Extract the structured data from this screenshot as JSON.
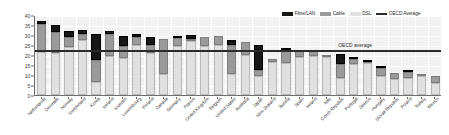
{
  "chart_data": {
    "type": "bar",
    "title": "",
    "subtitle": "",
    "xlabel": "",
    "ylabel": "",
    "ylim": [
      0,
      40
    ],
    "yticks": [
      0,
      5,
      10,
      15,
      20,
      25,
      30,
      35,
      40
    ],
    "grid": true,
    "stacked": true,
    "legend_position": "top-right",
    "categories": [
      "Netherlands",
      "Denmark",
      "Norway",
      "Switzerland",
      "Korea",
      "Iceland",
      "Sweden",
      "Luxembourg",
      "Finland",
      "Canada",
      "Germany",
      "France",
      "United Kingdom",
      "Belgium",
      "United States",
      "Australia",
      "Japan",
      "New Zealand",
      "Austria",
      "Spain",
      "Ireland",
      "Italy",
      "Czech Republic",
      "Portugal",
      "Greece",
      "Hungary",
      "Slovak Republic",
      "Poland",
      "Turkey",
      "Mexico"
    ],
    "series": [
      {
        "name": "DSL",
        "color": "#e0e0e0",
        "values": [
          21.4,
          21.1,
          24.1,
          27.4,
          6.4,
          19.5,
          18.6,
          24.8,
          21.2,
          10.4,
          24.5,
          27.0,
          24.3,
          25.2,
          10.3,
          20.0,
          9.4,
          16.4,
          15.8,
          18.9,
          19.6,
          19.1,
          8.5,
          15.7,
          16.2,
          9.7,
          8.2,
          8.3,
          9.3,
          6.2
        ]
      },
      {
        "name": "Cable",
        "color": "#9a9a9a",
        "values": [
          14.1,
          10.4,
          5.1,
          3.1,
          11.2,
          11.0,
          5.7,
          4.3,
          3.8,
          17.7,
          4.0,
          1.0,
          4.9,
          4.4,
          14.9,
          6.5,
          3.1,
          1.5,
          6.6,
          3.3,
          2.7,
          0.6,
          7.2,
          2.5,
          0.3,
          3.7,
          2.9,
          3.2,
          0.2,
          3.1
        ]
      },
      {
        "name": "Fibre/LAN",
        "color": "#161616",
        "values": [
          1.4,
          3.4,
          2.9,
          2.2,
          13.0,
          1.4,
          5.1,
          1.5,
          3.9,
          0.0,
          0.5,
          2.0,
          0.0,
          0.0,
          2.5,
          0.0,
          12.5,
          0.0,
          0.1,
          0.0,
          0.0,
          0.0,
          4.8,
          0.2,
          0.1,
          1.0,
          0.0,
          0.1,
          0.0,
          0.0
        ]
      }
    ],
    "reference_line": {
      "name": "OECD Average",
      "label": "OECD average",
      "value": 22.8,
      "color": "#2b2b2b"
    }
  },
  "legend": {
    "items": [
      {
        "label": "Fibre/LAN",
        "color": "#161616",
        "kind": "swatch"
      },
      {
        "label": "Cable",
        "color": "#9a9a9a",
        "kind": "swatch"
      },
      {
        "label": "DSL",
        "color": "#e0e0e0",
        "kind": "swatch"
      },
      {
        "label": "OECD Average",
        "color": "#2b2b2b",
        "kind": "line"
      }
    ]
  }
}
